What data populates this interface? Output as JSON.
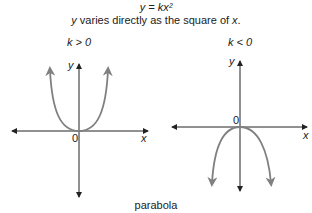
{
  "header": {
    "equation": "y = kx²",
    "description_y": "y",
    "description_mid": " varies directly as the square of ",
    "description_x": "x",
    "description_end": "."
  },
  "graphs": [
    {
      "condition": "k > 0",
      "y_label": "y",
      "x_label": "x",
      "origin_label": "0",
      "direction": "up"
    },
    {
      "condition": "k < 0",
      "y_label": "y",
      "x_label": "x",
      "origin_label": "0",
      "direction": "down"
    }
  ],
  "caption": "parabola",
  "colors": {
    "axis": "#222222",
    "curve": "#808080"
  }
}
